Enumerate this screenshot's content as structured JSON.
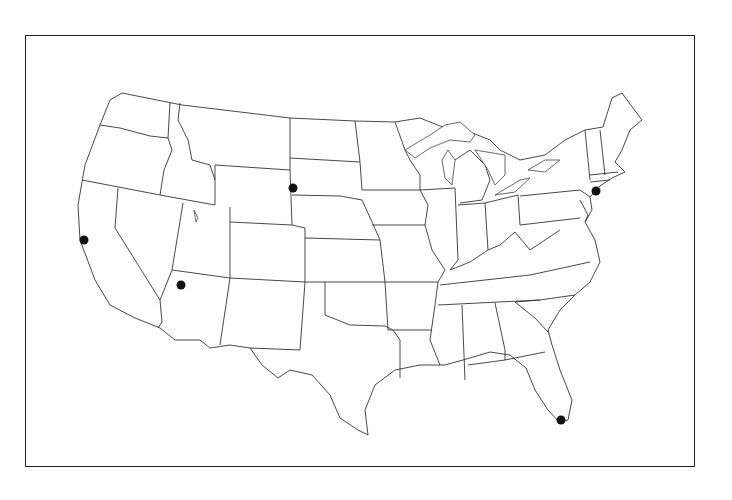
{
  "map": {
    "type": "outline-map",
    "region": "Contiguous United States",
    "style": "black state outlines on white, no labels",
    "frame_color": "#222222",
    "marker_color": "#111111",
    "markers": [
      {
        "id": "san-francisco",
        "x": 84,
        "y": 240
      },
      {
        "id": "phoenix",
        "x": 181,
        "y": 285
      },
      {
        "id": "south-dakota-west",
        "x": 293,
        "y": 188
      },
      {
        "id": "new-york-city",
        "x": 596,
        "y": 191
      },
      {
        "id": "miami",
        "x": 561,
        "y": 420
      }
    ]
  }
}
